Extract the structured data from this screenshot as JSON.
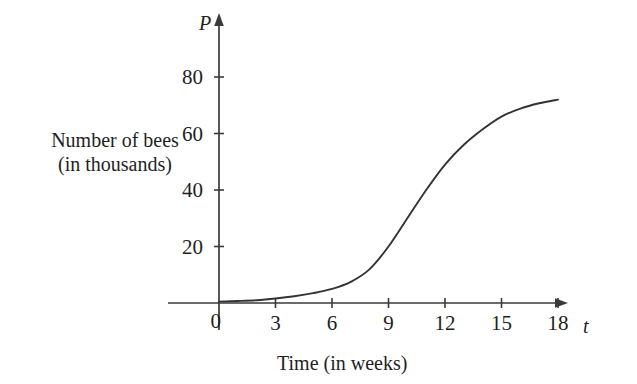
{
  "chart_data": {
    "type": "line",
    "title": "",
    "subtitle": "",
    "xlabel": "Time (in weeks)",
    "ylabel": "Number of bees (in thousands)",
    "ylabel_line1": "Number of bees",
    "ylabel_line2": "(in thousands)",
    "x_var": "t",
    "y_var": "P",
    "xlim": [
      0,
      19.5
    ],
    "ylim": [
      0,
      92
    ],
    "xticks": [
      0,
      3,
      6,
      9,
      12,
      15,
      18
    ],
    "yticks": [
      0,
      20,
      40,
      60,
      80
    ],
    "xtick_labels": [
      "0",
      "3",
      "6",
      "9",
      "12",
      "15",
      "18"
    ],
    "ytick_labels": [
      "0",
      "20",
      "40",
      "60",
      "80"
    ],
    "grid": false,
    "legend": null,
    "axis_arrows": true,
    "series": [
      {
        "name": "bee population",
        "color": "#333333",
        "x": [
          0,
          1,
          2,
          3,
          4,
          5,
          6,
          7,
          8,
          9,
          10,
          11,
          12,
          13,
          14,
          15,
          16,
          17,
          18
        ],
        "y": [
          0.5,
          0.7,
          1.0,
          1.6,
          2.4,
          3.5,
          5.0,
          7.5,
          12.0,
          20.0,
          30.0,
          40.0,
          49.0,
          56.0,
          61.5,
          66.0,
          68.8,
          70.7,
          72.0
        ]
      }
    ],
    "annotations": []
  },
  "axes": {
    "y_axis_name": "P",
    "x_axis_name": "t"
  }
}
